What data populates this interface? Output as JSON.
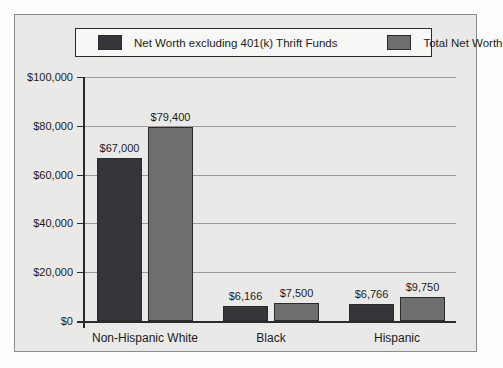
{
  "chart_data": {
    "type": "bar",
    "title": "",
    "categories": [
      "Non-Hispanic White",
      "Black",
      "Hispanic"
    ],
    "series": [
      {
        "name": "Net Worth excluding 401(k) Thrift Funds",
        "values": [
          67000,
          6166,
          6766
        ],
        "value_labels": [
          "$67,000",
          "$6,166",
          "$6,766"
        ],
        "color": "#35353a"
      },
      {
        "name": "Total Net Worth",
        "values": [
          79400,
          7500,
          9750
        ],
        "value_labels": [
          "$79,400",
          "$7,500",
          "$9,750"
        ],
        "color": "#6e6e6e"
      }
    ],
    "y_axis": {
      "min": 0,
      "max": 100000,
      "ticks": [
        {
          "value": 100000,
          "label": "$100,000"
        },
        {
          "value": 80000,
          "label": "$80,000"
        },
        {
          "value": 60000,
          "label": "$60,000"
        },
        {
          "value": 40000,
          "label": "$40,000"
        },
        {
          "value": 20000,
          "label": "$20,000"
        },
        {
          "value": 0,
          "label": "$0"
        }
      ]
    },
    "grid": true,
    "legend_position": "top"
  },
  "colors": {
    "panel_bg": "#e9e9e8",
    "panel_border": "#8a8a8a",
    "legend_bg": "#f7f7f5",
    "legend_border": "#2b2b2b",
    "gridline": "#9a9a9a",
    "axis": "#2b2b2b",
    "text": "#1c1c1c"
  }
}
